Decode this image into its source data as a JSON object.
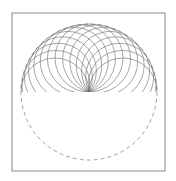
{
  "diagram": {
    "frame": {
      "x": 12,
      "y": 13,
      "width": 153,
      "height": 158,
      "stroke": "#6e6e6e"
    },
    "outer_circle": {
      "cx": 89,
      "cy": 92,
      "r": 68,
      "style": "dashed",
      "stroke": "#7a7a7a",
      "dash": "4,3"
    },
    "inner_circles": {
      "count": 15,
      "center_orbit_radius": 34,
      "radius": 34,
      "angle_start_deg": 0,
      "angle_end_deg": 180,
      "clip": "upper-half",
      "stroke": "#6a6a6a",
      "stroke_width": 0.6
    }
  }
}
